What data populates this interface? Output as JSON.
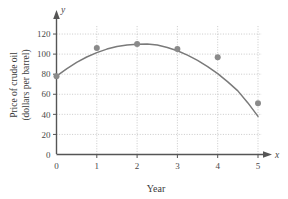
{
  "chart_data": {
    "type": "scatter",
    "title": "",
    "xlabel": "Year",
    "ylabel": "Price of crude oil (dollars per barrel)",
    "ylabel_lines": [
      "Price of crude oil",
      "(dollars per barrel)"
    ],
    "x_axis_variable": "x",
    "y_axis_variable": "y",
    "xlim": [
      0,
      5
    ],
    "ylim": [
      0,
      130
    ],
    "xticks": [
      "0",
      "1",
      "2",
      "3",
      "4",
      "5"
    ],
    "xtick_values": [
      0,
      1,
      2,
      3,
      4,
      5
    ],
    "yticks": [
      "0",
      "20",
      "40",
      "60",
      "80",
      "100",
      "120"
    ],
    "ytick_values": [
      0,
      20,
      40,
      60,
      80,
      100,
      120
    ],
    "grid": true,
    "grid_style": "dotted",
    "legend": "none",
    "x": [
      0,
      1,
      2,
      3,
      4,
      5
    ],
    "values": [
      78,
      106,
      110,
      105,
      97,
      51
    ],
    "points": [
      {
        "x": 0,
        "y": 78
      },
      {
        "x": 1,
        "y": 106
      },
      {
        "x": 2,
        "y": 110
      },
      {
        "x": 3,
        "y": 105
      },
      {
        "x": 4,
        "y": 97
      },
      {
        "x": 5,
        "y": 51
      }
    ],
    "fit_curve": {
      "kind": "quadratic",
      "x": [
        0,
        0.25,
        0.5,
        0.75,
        1,
        1.25,
        1.5,
        1.75,
        2,
        2.25,
        2.5,
        2.75,
        3,
        3.25,
        3.5,
        3.75,
        4,
        4.25,
        4.5,
        4.75,
        5
      ],
      "y": [
        78,
        85.3,
        91.7,
        97.1,
        101.5,
        105,
        107.5,
        109.1,
        109.8,
        110,
        109,
        106.6,
        103.3,
        99,
        93.8,
        87.6,
        80.5,
        72.4,
        63.4,
        51.4,
        38
      ]
    },
    "colors": {
      "curve": "#7a7a7a",
      "marker": "#8a8a8a",
      "axis": "#555555",
      "grid": "#bdbdbd",
      "text": "#3b3b3b"
    }
  }
}
